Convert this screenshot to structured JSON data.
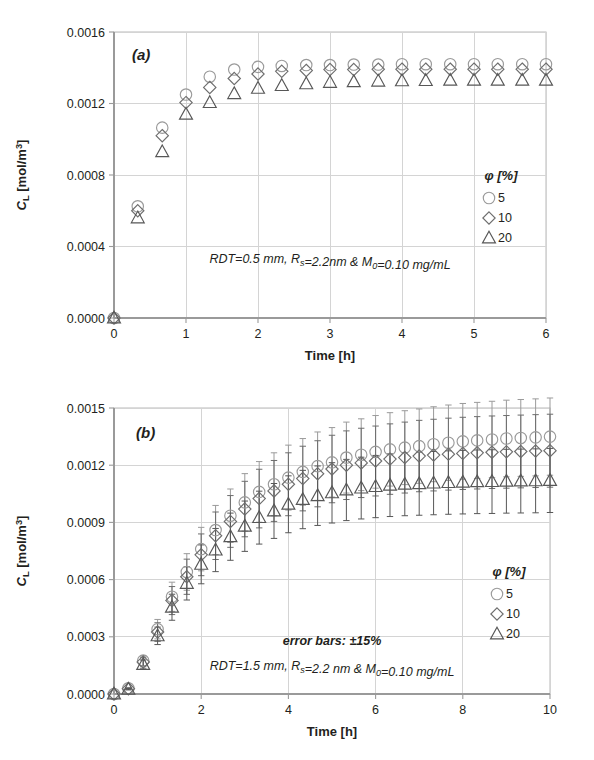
{
  "figure": {
    "panels": [
      "a",
      "b"
    ]
  },
  "chart_data": [
    {
      "type": "scatter",
      "panel_label": "(a)",
      "title": "",
      "xlabel": "Time [h]",
      "ylabel": "C_L [mol/m³]",
      "ylabel_parts": {
        "main": "C",
        "sub": "L",
        "rest": " [mol/m",
        "sup": "3",
        "tail": "]"
      },
      "xlim": [
        0,
        6
      ],
      "ylim": [
        0,
        0.0016
      ],
      "xticks": [
        0,
        1,
        2,
        3,
        4,
        5,
        6
      ],
      "xticklabels": [
        "0",
        "1",
        "2",
        "3",
        "4",
        "5",
        "6"
      ],
      "yticks": [
        0,
        0.0004,
        0.0008,
        0.0012,
        0.0016
      ],
      "yticklabels": [
        "0.0000",
        "0.0004",
        "0.0008",
        "0.0012",
        "0.0016"
      ],
      "grid": true,
      "legend_title": "φ [%]",
      "legend_position": "right-inside",
      "error_bars": false,
      "annotations": [
        {
          "text": "RDT=0.5 mm, Rₛ=2.2nm & M₀=0.10 mg/mL",
          "x": 3.0,
          "y": 0.00031,
          "bold": false
        }
      ],
      "annotation_rich": [
        {
          "segments": [
            {
              "t": "RDT=0.5 mm, R",
              "k": "n"
            },
            {
              "t": "s",
              "k": "sub"
            },
            {
              "t": "=2.2nm & M",
              "k": "n"
            },
            {
              "t": "0",
              "k": "sub"
            },
            {
              "t": "=0.10 mg/mL",
              "k": "n"
            }
          ],
          "x": 3.0,
          "y": 0.00031,
          "bold": false
        }
      ],
      "x": [
        0,
        0.33,
        0.67,
        1.0,
        1.33,
        1.67,
        2.0,
        2.33,
        2.67,
        3.0,
        3.33,
        3.67,
        4.0,
        4.33,
        4.67,
        5.0,
        5.33,
        5.67,
        6.0
      ],
      "series": [
        {
          "name": "5",
          "marker": "circle",
          "color": "#9a9a9a",
          "values": [
            0.0,
            0.000625,
            0.001065,
            0.00125,
            0.00135,
            0.00139,
            0.001405,
            0.00141,
            0.001415,
            0.001415,
            0.001418,
            0.001418,
            0.00142,
            0.00142,
            0.00142,
            0.00142,
            0.00142,
            0.00142,
            0.00142
          ]
        },
        {
          "name": "10",
          "marker": "diamond",
          "color": "#6d6d6d",
          "values": [
            0.0,
            0.0006,
            0.00102,
            0.001205,
            0.00129,
            0.00134,
            0.001365,
            0.00138,
            0.001385,
            0.00139,
            0.00139,
            0.001392,
            0.001392,
            0.001392,
            0.001392,
            0.001392,
            0.001392,
            0.001392,
            0.001392
          ]
        },
        {
          "name": "20",
          "marker": "triangle",
          "color": "#575757",
          "values": [
            0.0,
            0.00056,
            0.00093,
            0.00114,
            0.001205,
            0.001255,
            0.001285,
            0.0013,
            0.00131,
            0.001318,
            0.001322,
            0.001325,
            0.001327,
            0.001328,
            0.00133,
            0.00133,
            0.00133,
            0.00133,
            0.00133
          ]
        }
      ]
    },
    {
      "type": "scatter",
      "panel_label": "(b)",
      "title": "",
      "xlabel": "Time [h]",
      "ylabel": "C_L [mol/m³]",
      "ylabel_parts": {
        "main": "C",
        "sub": "L",
        "rest": " [mol/m",
        "sup": "3",
        "tail": "]"
      },
      "xlim": [
        0,
        10
      ],
      "ylim": [
        0,
        0.0015
      ],
      "xticks": [
        0,
        2,
        4,
        6,
        8,
        10
      ],
      "xticklabels": [
        "0",
        "2",
        "4",
        "6",
        "8",
        "10"
      ],
      "yticks": [
        0,
        0.0003,
        0.0006,
        0.0009,
        0.0012,
        0.0015
      ],
      "yticklabels": [
        "0.0000",
        "0.0003",
        "0.0006",
        "0.0009",
        "0.0012",
        "0.0015"
      ],
      "grid": true,
      "legend_title": "φ [%]",
      "legend_position": "right-inside",
      "error_bars": true,
      "error_percent": 15,
      "annotations": [
        {
          "text": "error bars: ±15%",
          "x": 5.0,
          "y": 0.000255,
          "bold": true
        },
        {
          "text": "RDT=1.5 mm, Rₛ=2.2 nm & M₀=0.10 mg/mL",
          "x": 5.0,
          "y": 0.000125,
          "bold": false
        }
      ],
      "annotation_rich": [
        {
          "segments": [
            {
              "t": "error bars: ±15%",
              "k": "n"
            }
          ],
          "x": 5.0,
          "y": 0.000255,
          "bold": true
        },
        {
          "segments": [
            {
              "t": "RDT=1.5 mm, R",
              "k": "n"
            },
            {
              "t": "s",
              "k": "sub"
            },
            {
              "t": "=2.2 nm & M",
              "k": "n"
            },
            {
              "t": "0",
              "k": "sub"
            },
            {
              "t": "=0.10 mg/mL",
              "k": "n"
            }
          ],
          "x": 5.0,
          "y": 0.000125,
          "bold": false
        }
      ],
      "x": [
        0,
        0.33,
        0.67,
        1.0,
        1.33,
        1.67,
        2.0,
        2.33,
        2.67,
        3.0,
        3.33,
        3.67,
        4.0,
        4.33,
        4.67,
        5.0,
        5.33,
        5.67,
        6.0,
        6.33,
        6.67,
        7.0,
        7.33,
        7.67,
        8.0,
        8.33,
        8.67,
        9.0,
        9.33,
        9.67,
        10.0
      ],
      "series": [
        {
          "name": "5",
          "marker": "circle",
          "color": "#9a9a9a",
          "values": [
            0.0,
            3e-05,
            0.000175,
            0.00034,
            0.00051,
            0.00064,
            0.00076,
            0.00086,
            0.000935,
            0.001005,
            0.00106,
            0.0011,
            0.001135,
            0.001165,
            0.001195,
            0.001215,
            0.00124,
            0.001255,
            0.00127,
            0.001283,
            0.001292,
            0.0013,
            0.00131,
            0.001318,
            0.001325,
            0.00133,
            0.001335,
            0.00134,
            0.001343,
            0.001346,
            0.00135
          ]
        },
        {
          "name": "10",
          "marker": "diamond",
          "color": "#6d6d6d",
          "values": [
            0.0,
            2.8e-05,
            0.000168,
            0.000325,
            0.00049,
            0.000615,
            0.00073,
            0.00083,
            0.000905,
            0.00097,
            0.001025,
            0.001065,
            0.0011,
            0.00113,
            0.001155,
            0.00118,
            0.0012,
            0.001212,
            0.001222,
            0.001232,
            0.00124,
            0.001248,
            0.001253,
            0.001258,
            0.001262,
            0.001265,
            0.001268,
            0.00127,
            0.001272,
            0.001274,
            0.001276
          ]
        },
        {
          "name": "20",
          "marker": "triangle",
          "color": "#575757",
          "values": [
            0.0,
            2.5e-05,
            0.000155,
            0.000305,
            0.000455,
            0.00058,
            0.00068,
            0.000755,
            0.000825,
            0.00088,
            0.000925,
            0.00096,
            0.000995,
            0.00102,
            0.00104,
            0.001055,
            0.00107,
            0.00108,
            0.001088,
            0.001095,
            0.0011,
            0.001103,
            0.001106,
            0.001109,
            0.001111,
            0.001113,
            0.001114,
            0.001116,
            0.001117,
            0.001118,
            0.00112
          ]
        }
      ]
    }
  ]
}
